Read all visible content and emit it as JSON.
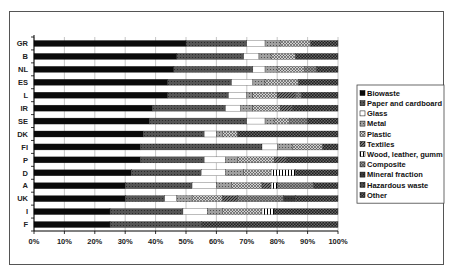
{
  "chart_data": {
    "type": "bar",
    "orientation": "horizontal",
    "stacked": true,
    "normalized": true,
    "title": "",
    "xlabel": "",
    "ylabel": "",
    "xlim": [
      0,
      100
    ],
    "x_ticks": [
      "0%",
      "10%",
      "20%",
      "30%",
      "40%",
      "50%",
      "60%",
      "70%",
      "80%",
      "90%",
      "100%"
    ],
    "grid": "vertical",
    "legend_position": "right",
    "categories": [
      "GR",
      "B",
      "NL",
      "ES",
      "L",
      "IR",
      "SE",
      "DK",
      "FI",
      "P",
      "D",
      "A",
      "UK",
      "I",
      "F"
    ],
    "series": [
      {
        "name": "Biowaste",
        "values": [
          50,
          47,
          46,
          44,
          44,
          39,
          38,
          36,
          35,
          35,
          32,
          30,
          30,
          25,
          25
        ]
      },
      {
        "name": "Paper and cardboard",
        "values": [
          20,
          22,
          26,
          21,
          20,
          24,
          32,
          20,
          40,
          21,
          23,
          22,
          13,
          24,
          30
        ]
      },
      {
        "name": "Glass",
        "values": [
          6,
          5,
          4,
          7,
          6,
          5,
          6,
          4,
          5,
          7,
          8,
          8,
          4,
          8,
          0
        ]
      },
      {
        "name": "Metal",
        "values": [
          5,
          4,
          4,
          4,
          2,
          4,
          3,
          2,
          5,
          4,
          6,
          5,
          5,
          5,
          0
        ]
      },
      {
        "name": "Plastic",
        "values": [
          10,
          8,
          9,
          11,
          8,
          9,
          5,
          5,
          10,
          12,
          9,
          10,
          10,
          13,
          0
        ]
      },
      {
        "name": "Textiles",
        "values": [
          0,
          0,
          0,
          0,
          6,
          4,
          0,
          0,
          0,
          4,
          0,
          3,
          5,
          0,
          0
        ]
      },
      {
        "name": "Wood, leather, gumm",
        "values": [
          0,
          0,
          0,
          0,
          0,
          0,
          0,
          0,
          0,
          0,
          8,
          2,
          0,
          4,
          0
        ]
      },
      {
        "name": "Composite",
        "values": [
          0,
          0,
          4,
          0,
          2,
          0,
          6,
          0,
          0,
          0,
          0,
          12,
          15,
          0,
          0
        ]
      },
      {
        "name": "Mineral fraction",
        "values": [
          0,
          0,
          0,
          0,
          0,
          0,
          0,
          0,
          0,
          0,
          0,
          0,
          4,
          0,
          0
        ]
      },
      {
        "name": "Hazardous waste",
        "values": [
          0,
          0,
          0,
          0,
          0,
          0,
          0,
          0,
          0,
          0,
          0,
          0,
          0,
          0,
          0
        ]
      },
      {
        "name": "Other",
        "values": [
          9,
          14,
          7,
          13,
          12,
          15,
          10,
          33,
          5,
          17,
          14,
          8,
          14,
          21,
          45
        ]
      }
    ]
  },
  "series_styles": [
    {
      "fill": "#0a0a0a",
      "pattern": "solid"
    },
    {
      "fill": "#555555",
      "pattern": "dots"
    },
    {
      "fill": "#ffffff",
      "pattern": "solid"
    },
    {
      "fill": "#a0a0a0",
      "pattern": "dots"
    },
    {
      "fill": "#cfcfcf",
      "pattern": "cross"
    },
    {
      "fill": "#707070",
      "pattern": "diag"
    },
    {
      "fill": "#ffffff",
      "pattern": "vlines"
    },
    {
      "fill": "#909090",
      "pattern": "cross"
    },
    {
      "fill": "#3a3a3a",
      "pattern": "dots"
    },
    {
      "fill": "#4a4a4a",
      "pattern": "dots"
    },
    {
      "fill": "#1e1e1e",
      "pattern": "checker"
    }
  ]
}
